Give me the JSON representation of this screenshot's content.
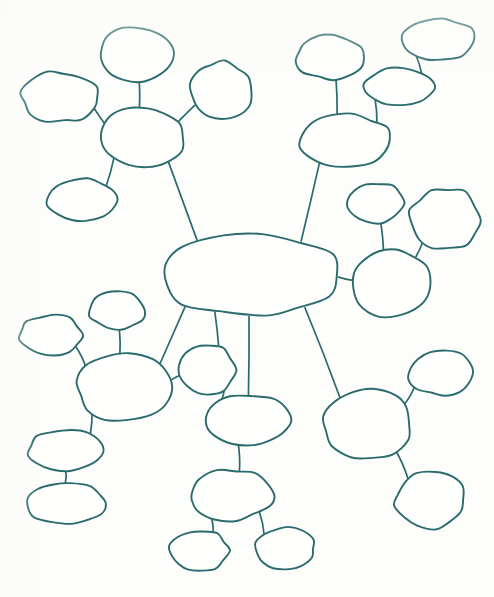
{
  "document": {
    "title": "Blank Mind Map Worksheet",
    "kind": "hand-drawn mind map",
    "background_color": "#fdfdfc",
    "stroke_color": "#2a6b6b",
    "bubble_fill": "#fffffe",
    "width": 494,
    "height": 597,
    "node_count": 28,
    "edge_count": 27,
    "all_bubbles_blank": true
  },
  "chart_data": {
    "type": "diagram",
    "subtype": "node-link mind map",
    "title": "",
    "note": "All bubbles are empty — blank worksheet template",
    "layout": "radial hub-and-spoke with one central node and five peripheral clusters",
    "nodes": [
      {
        "id": "center",
        "label": "",
        "cx": 252,
        "cy": 275,
        "rx": 88,
        "ry": 42,
        "role": "central-hub"
      },
      {
        "id": "tl-hub",
        "label": "",
        "cx": 142,
        "cy": 137,
        "rx": 42,
        "ry": 30,
        "role": "cluster-hub"
      },
      {
        "id": "tl-top",
        "label": "",
        "cx": 137,
        "cy": 54,
        "rx": 38,
        "ry": 27,
        "role": "leaf"
      },
      {
        "id": "tl-left",
        "label": "",
        "cx": 60,
        "cy": 97,
        "rx": 38,
        "ry": 25,
        "role": "leaf"
      },
      {
        "id": "tl-right",
        "label": "",
        "cx": 221,
        "cy": 91,
        "rx": 31,
        "ry": 29,
        "role": "leaf"
      },
      {
        "id": "tl-low",
        "label": "",
        "cx": 83,
        "cy": 200,
        "rx": 35,
        "ry": 21,
        "role": "leaf"
      },
      {
        "id": "tr-hub",
        "label": "",
        "cx": 345,
        "cy": 140,
        "rx": 45,
        "ry": 26,
        "role": "cluster-hub"
      },
      {
        "id": "tr-up",
        "label": "",
        "cx": 330,
        "cy": 57,
        "rx": 34,
        "ry": 22,
        "role": "leaf"
      },
      {
        "id": "tr-mid",
        "label": "",
        "cx": 400,
        "cy": 87,
        "rx": 35,
        "ry": 19,
        "role": "leaf"
      },
      {
        "id": "tr-far",
        "label": "",
        "cx": 438,
        "cy": 39,
        "rx": 36,
        "ry": 21,
        "role": "leaf"
      },
      {
        "id": "r-hub",
        "label": "",
        "cx": 391,
        "cy": 282,
        "rx": 39,
        "ry": 34,
        "role": "cluster-hub"
      },
      {
        "id": "r-up",
        "label": "",
        "cx": 375,
        "cy": 203,
        "rx": 29,
        "ry": 20,
        "role": "leaf"
      },
      {
        "id": "r-upright",
        "label": "",
        "cx": 445,
        "cy": 219,
        "rx": 35,
        "ry": 31,
        "role": "leaf"
      },
      {
        "id": "bl-hub",
        "label": "",
        "cx": 124,
        "cy": 388,
        "rx": 47,
        "ry": 33,
        "role": "cluster-hub"
      },
      {
        "id": "bl-top",
        "label": "",
        "cx": 117,
        "cy": 311,
        "rx": 27,
        "ry": 19,
        "role": "leaf"
      },
      {
        "id": "bl-left",
        "label": "",
        "cx": 51,
        "cy": 335,
        "rx": 31,
        "ry": 20,
        "role": "leaf"
      },
      {
        "id": "bl-c1",
        "label": "",
        "cx": 65,
        "cy": 450,
        "rx": 37,
        "ry": 20,
        "role": "chain"
      },
      {
        "id": "bl-c2",
        "label": "",
        "cx": 66,
        "cy": 504,
        "rx": 38,
        "ry": 21,
        "role": "chain"
      },
      {
        "id": "bm-small",
        "label": "",
        "cx": 207,
        "cy": 370,
        "rx": 28,
        "ry": 25,
        "role": "leaf"
      },
      {
        "id": "bm-1",
        "label": "",
        "cx": 247,
        "cy": 420,
        "rx": 42,
        "ry": 25,
        "role": "chain"
      },
      {
        "id": "bm-2",
        "label": "",
        "cx": 231,
        "cy": 495,
        "rx": 41,
        "ry": 25,
        "role": "chain"
      },
      {
        "id": "bm-l",
        "label": "",
        "cx": 199,
        "cy": 551,
        "rx": 29,
        "ry": 21,
        "role": "leaf"
      },
      {
        "id": "bm-r",
        "label": "",
        "cx": 285,
        "cy": 549,
        "rx": 30,
        "ry": 21,
        "role": "leaf"
      },
      {
        "id": "br-hub",
        "label": "",
        "cx": 367,
        "cy": 424,
        "rx": 45,
        "ry": 34,
        "role": "cluster-hub"
      },
      {
        "id": "br-up",
        "label": "",
        "cx": 442,
        "cy": 373,
        "rx": 33,
        "ry": 22,
        "role": "leaf"
      },
      {
        "id": "br-down",
        "label": "",
        "cx": 430,
        "cy": 500,
        "rx": 35,
        "ry": 28,
        "role": "leaf"
      }
    ],
    "edges": [
      {
        "from": "center",
        "to": "tl-hub"
      },
      {
        "from": "center",
        "to": "tr-hub"
      },
      {
        "from": "center",
        "to": "r-hub"
      },
      {
        "from": "center",
        "to": "bl-hub"
      },
      {
        "from": "center",
        "to": "bm-small"
      },
      {
        "from": "center",
        "to": "bm-1"
      },
      {
        "from": "center",
        "to": "br-hub"
      },
      {
        "from": "tl-hub",
        "to": "tl-top"
      },
      {
        "from": "tl-hub",
        "to": "tl-left"
      },
      {
        "from": "tl-hub",
        "to": "tl-right"
      },
      {
        "from": "tl-hub",
        "to": "tl-low"
      },
      {
        "from": "tr-hub",
        "to": "tr-up"
      },
      {
        "from": "tr-hub",
        "to": "tr-mid"
      },
      {
        "from": "tr-mid",
        "to": "tr-far"
      },
      {
        "from": "r-hub",
        "to": "r-up"
      },
      {
        "from": "r-hub",
        "to": "r-upright"
      },
      {
        "from": "bl-hub",
        "to": "bl-top"
      },
      {
        "from": "bl-hub",
        "to": "bl-left"
      },
      {
        "from": "bl-hub",
        "to": "bl-c1"
      },
      {
        "from": "bl-c1",
        "to": "bl-c2"
      },
      {
        "from": "bl-hub",
        "to": "bm-small"
      },
      {
        "from": "bm-small",
        "to": "bm-1"
      },
      {
        "from": "bm-1",
        "to": "bm-2"
      },
      {
        "from": "bm-2",
        "to": "bm-l"
      },
      {
        "from": "bm-2",
        "to": "bm-r"
      },
      {
        "from": "br-hub",
        "to": "br-up"
      },
      {
        "from": "br-hub",
        "to": "br-down"
      }
    ]
  }
}
